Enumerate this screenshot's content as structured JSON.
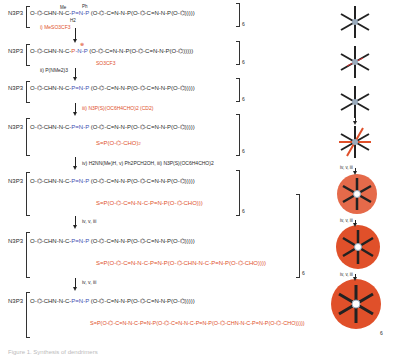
{
  "figure": {
    "caption": "Figure 1. Synthesis of dendrimers",
    "rows": [
      {
        "id": "row1",
        "core": "N3P3",
        "chain": "O-C6H4-CHN-N(Me)-C(H2)-P(Ph2)=N-P(S)",
        "branch": "(O-C6H4-CH=N-N(Me)-P(S)(O-C6H4)2)2)2",
        "mult": "6"
      },
      {
        "id": "row2",
        "core": "N3P3",
        "chain": "O-C6H4-CHN-N(Me)-C(H2)-P+(Ph2)-N(Me)-P",
        "branch": "(O-C6H4-CH=N-N(Me)-P(S)(O-C6H4)2)2)2",
        "counterion": "SO3CF3-",
        "mult": "6"
      },
      {
        "id": "row3",
        "core": "N3P3",
        "chain": "O-C6H4-CHN-N(Me)-C(H2)-P(Ph2)=N-P",
        "branch": "(O-C6H4-CH=N-N(Me)-P(S)(O-C6H4)2)2)2",
        "mult": "6"
      },
      {
        "id": "row4",
        "core": "N3P3",
        "chain": "O-C6H4-CHN-N(Me)-C(H2)-P(Ph2)=N-P",
        "branch": "(O-C6H4-CH=N-N(Me)-P(S)(O-C6H4)2)2)2",
        "red_branch": "N=P(S)(O-C6H4-CHO)2",
        "mult": "6"
      },
      {
        "id": "row5",
        "core": "N3P3",
        "chain": "O-C6H4-CHN-N(Me)-C(H2)-P(Ph2)=N-P",
        "branch": "(O-C6H4-CH=N-N(Me)-P(S)(O-C6H4)2)2)2",
        "red_branch": "S=P(O-C6H4-CH=N-N(Me)-C(H2)-P(Ph2)=N-P(S)(O-C6H4-CHO)2)2)2",
        "mult": "6"
      },
      {
        "id": "row6",
        "core": "N3P3",
        "chain": "O-C6H4-CHN-N(Me)-C(H2)-P(Ph2)=N-P",
        "branch": "(O-C6H4-CH=N-N(Me)-P(S)(O-C6H4)2)2)2",
        "red_branch": "S=P(O-C6H4-CH=N-N(Me)-C(H2)-P(Ph2)=N-P(S)(O-C6H4-CHN-N(Me)-C(H2)-P(Ph2)=N-P(S)(O-C6H4-CHO)2)2)2)2",
        "mult": "6"
      },
      {
        "id": "row7",
        "core": "N3P3",
        "chain": "O-C6H4-CHN-N(Me)-C(H2)-P(Ph2)=N-P",
        "branch": "(O-C6H4-CH=N-N(Me)-P(S)(O-C6H4)2)2)2",
        "red_branch": "S=P(O-C6H4-CH=N-N(Me)-C(H2)-P(Ph2)=N-P(S)(O-C6H4-CH=N-N(Me)-C(H2)-P(Ph2)=N-P(S)(O-C6H4-CHN-N-C(MeH2)-P(Ph2)=N-P(S)(O-C6H4-CHO)2)2)2)2",
        "mult": "6"
      }
    ],
    "steps": [
      {
        "label": "i) MeSO3CF3",
        "highlight": "Me"
      },
      {
        "label": "ii) P(NMe2)3"
      },
      {
        "label": "iii) N3P(S)(OC6H4CHO)2 (CD2)"
      },
      {
        "label": "iv) H2NN(Me)H,  v) Ph2PCH2OH,  iii) N3P(S)(OC6H4CHO)2"
      },
      {
        "label": "iv, v, iii"
      },
      {
        "label": "iv, v, iii"
      }
    ],
    "right_steps": [
      "i",
      "ii",
      "iii",
      "iv, v, iii",
      "iv, v, iii",
      "iv, v, iii"
    ],
    "text": {
      "N3P3": "N3P3",
      "O": "O",
      "Me": "Me",
      "Ph": "Ph",
      "H2": "H2",
      "S": "S",
      "H": "H",
      "N": "N",
      "CHNN": "CHN-N",
      "C": "C",
      "PNP": "P=N-P",
      "CN": "C=N-N",
      "P": "P",
      "CHO": "CHO",
      "sub2": "2",
      "sub6": "6",
      "plus": "⊕",
      "otf": "SO3CF3"
    },
    "colors": {
      "black": "#2a2a2a",
      "red": "#e0502a",
      "blue": "#3b4fb0"
    }
  }
}
